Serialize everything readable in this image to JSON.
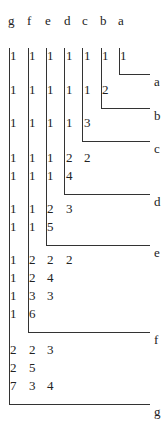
{
  "headers": [
    "g",
    "f",
    "e",
    "d",
    "c",
    "b",
    "a"
  ],
  "groups": [
    {
      "label": "a",
      "rows": [
        [
          "1",
          "1",
          "1",
          "1",
          "1",
          "1",
          "1"
        ]
      ]
    },
    {
      "label": "b",
      "rows": [
        [
          "1",
          "1",
          "1",
          "1",
          "1",
          "2"
        ]
      ]
    },
    {
      "label": "c",
      "rows": [
        [
          "1",
          "1",
          "1",
          "1",
          "3"
        ]
      ]
    },
    {
      "label": "d",
      "rows": [
        [
          "1",
          "1",
          "1",
          "2",
          "2"
        ],
        [
          "1",
          "1",
          "1",
          "4"
        ]
      ]
    },
    {
      "label": "e",
      "rows": [
        [
          "1",
          "1",
          "2",
          "3"
        ],
        [
          "1",
          "1",
          "5"
        ]
      ]
    },
    {
      "label": "f",
      "rows": [
        [
          "1",
          "2",
          "2",
          "2"
        ],
        [
          "1",
          "2",
          "4"
        ],
        [
          "1",
          "3",
          "3"
        ],
        [
          "1",
          "6"
        ]
      ]
    },
    {
      "label": "g",
      "rows": [
        [
          "2",
          "2",
          "3"
        ],
        [
          "2",
          "5"
        ],
        [
          "7",
          "3",
          "4"
        ]
      ]
    }
  ]
}
